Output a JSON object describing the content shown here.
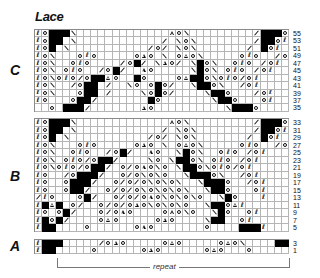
{
  "title": "Lace",
  "legend_symbols": {
    ".": "knit (empty)",
    "#": "no stitch (black)",
    "o": "yarn over (circle)",
    "/": "k2tog",
    "\\": "ssk",
    "T": "double decrease (triangle)",
    "Q": "twisted stitch"
  },
  "columns": 36,
  "sections": [
    {
      "label": "C",
      "rows": [
        {
          "num": "55",
          "cells": "Qo###\\.............To\\........./###oQ"
        },
        {
          "num": "53",
          "cells": "Qo##.\\............/.\\o\\......../##oQ"
        },
        {
          "num": "51",
          "cells": "Qo#.\\.........../o/.\\o\\......./.#oQ"
        },
        {
          "num": "49",
          "cells": "Qo\\...oQo.....oTo.\\.oTo\\.....oQo../oQ"
        },
        {
          "num": "47",
          "cells": "Qo\\..oQo..../o#/.\\To/.\\#o\\..oQo./oQ"
        },
        {
          "num": "45",
          "cells": "Qo\\.oQo../o#/..To.....\\#o\\.oQo./oQ"
        },
        {
          "num": "43",
          "cells": "Qo\\oQo/o##To..#o....oT##o\\oQo/oQ"
        },
        {
          "num": "41",
          "cells": "Qo\\../o##./..\\o.o#o/..\\##o\\../oQ"
        },
        {
          "num": "39",
          "cells": "Qo\\...o##./....\\o#o/....\\##o.../oQ"
        },
        {
          "num": "37",
          "cells": "Qo...o##/.......#o.......\\##o...oQ"
        },
        {
          "num": "35",
          "cells": "..o.###/.......To..........\\###o..."
        }
      ]
    },
    {
      "label": "B",
      "rows": [
        {
          "num": "33",
          "cells": "Qo###\\.............To\\........./###oQ"
        },
        {
          "num": "31",
          "cells": "Qo##.\\............/.\\o\\......../##oQ"
        },
        {
          "num": "29",
          "cells": "Qo#.\\.........../o/.\\o\\......./.#oQ"
        },
        {
          "num": "27",
          "cells": "Qo\\...oQo.....oTo.\\.oTo\\.....oQo../oQ"
        },
        {
          "num": "25",
          "cells": "Qo\\..oQo../o#/..To..\\#o\\..oQo./oQ"
        },
        {
          "num": "23",
          "cells": "Qo\\.oQo/o##/....\\o.\\##o\\.oQo./oQ"
        },
        {
          "num": "21",
          "cells": "Qo\\oQo/o##/.o/oTo\\o.\\##o\\oQo/oQ"
        },
        {
          "num": "19",
          "cells": "Qo../o###/..o/o\\o\\o..\\###o\\../oQ"
        },
        {
          "num": "17",
          "cells": "Qo..o###/..o/o/o\\o\\o\\..\\###o../oQ"
        },
        {
          "num": "15",
          "cells": "Qo..o##/..o/o/o\\o\\o\\o\\..\\##o...oQ"
        },
        {
          "num": "13",
          "cells": "/Qo...o#/..o/o/oTo\\o\\o\\o..\\#o...Q."
        },
        {
          "num": "11",
          "cells": "Q#T#.o/..o/o/oTo\\o\\o\\o..\\##oTQ"
        },
        {
          "num": "9",
          "cells": "Qo.o#/...o/oTo....oTo\\o..\\#o..oQ"
        },
        {
          "num": "7",
          "cells": "Q#o#/....oTo.....oTo....\\##..oQ"
        },
        {
          "num": "5",
          "cells": "Q##....o......oTo.......o....###Q"
        }
      ]
    },
    {
      "label": "A",
      "rows": [
        {
          "num": "3",
          "cells": "Q###...../oTo.....oTo.....oTo\\....###Q"
        },
        {
          "num": "1",
          "cells": "Q##.....o......oTo......oTo...o.....##Q"
        }
      ]
    }
  ],
  "repeat_label": "repeat"
}
